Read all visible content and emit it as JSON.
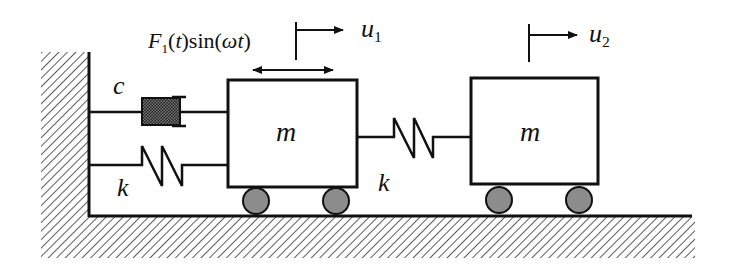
{
  "diagram": {
    "colors": {
      "line": "#111111",
      "hatch": "#333333",
      "damper_fill": "#3a3a3a",
      "wheel_fill": "#8c8c8c",
      "background": "#ffffff"
    },
    "labels": {
      "force": {
        "F": "F",
        "sub": "1",
        "rest_t": "(t)",
        "sin": "sin(",
        "omega": "ω",
        "t": "t",
        "close": ")"
      },
      "u1": {
        "base": "u",
        "sub": "1"
      },
      "u2": {
        "base": "u",
        "sub": "2"
      },
      "damper": "c",
      "spring_wall": "k",
      "spring_between": "k",
      "mass1": "m",
      "mass2": "m"
    },
    "components": [
      {
        "id": "wall",
        "type": "fixed-support"
      },
      {
        "id": "ground",
        "type": "fixed-surface"
      },
      {
        "id": "damper",
        "type": "dashpot",
        "label": "c",
        "connects": [
          "wall",
          "mass1"
        ]
      },
      {
        "id": "spring1",
        "type": "spring",
        "label": "k",
        "connects": [
          "wall",
          "mass1"
        ]
      },
      {
        "id": "mass1",
        "type": "mass",
        "label": "m",
        "wheels": 2
      },
      {
        "id": "spring2",
        "type": "spring",
        "label": "k",
        "connects": [
          "mass1",
          "mass2"
        ]
      },
      {
        "id": "mass2",
        "type": "mass",
        "label": "m",
        "wheels": 2
      },
      {
        "id": "force",
        "type": "harmonic-force",
        "label": "F1(t)sin(ωt)",
        "acts_on": "mass1"
      },
      {
        "id": "u1",
        "type": "displacement",
        "label": "u1",
        "of": "mass1"
      },
      {
        "id": "u2",
        "type": "displacement",
        "label": "u2",
        "of": "mass2"
      }
    ]
  }
}
